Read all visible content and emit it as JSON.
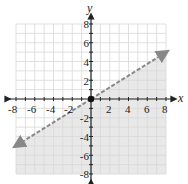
{
  "chart_data": {
    "type": "line",
    "title": "",
    "xlabel": "x",
    "ylabel": "y",
    "xlim": [
      -8,
      8
    ],
    "ylim": [
      -8,
      8
    ],
    "grid": true,
    "x_ticks": [
      "-8",
      "-6",
      "-4",
      "-2",
      "2",
      "4",
      "6",
      "8"
    ],
    "y_ticks": [
      "8",
      "6",
      "4",
      "2",
      "-2",
      "-4",
      "-6",
      "-8"
    ],
    "boundary_line": {
      "style": "dashed",
      "equation": "y = (5/8)x",
      "points": [
        [
          -8,
          -5
        ],
        [
          0,
          0
        ],
        [
          8,
          5
        ]
      ]
    },
    "shaded_region": "below line",
    "points": [
      {
        "x": 0,
        "y": 0,
        "filled": true
      }
    ]
  },
  "colors": {
    "grid": "#d8d8d8",
    "shade": "#e8e8e8",
    "line": "#888888",
    "axis": "#222222"
  }
}
